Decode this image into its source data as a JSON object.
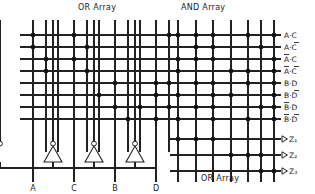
{
  "diagram": {
    "headers": {
      "or_array_top": "OR Array",
      "and_array_top": "AND Array",
      "or_array_bottom": "OR Array"
    },
    "inputs": [
      {
        "id": "A",
        "label": "A",
        "x": 33
      },
      {
        "id": "C",
        "label": "C",
        "x": 74
      },
      {
        "id": "B",
        "label": "B",
        "x": 115
      },
      {
        "id": "D",
        "label": "D",
        "x": 156
      }
    ],
    "product_terms": [
      {
        "label": "A·C",
        "base": "A·C",
        "bar_left": false,
        "bar_right": false,
        "y": 35
      },
      {
        "label": "A·C̅",
        "base": "A·C",
        "bar_left": false,
        "bar_right": true,
        "y": 47
      },
      {
        "label": "A̅·C",
        "base": "A·C",
        "bar_left": true,
        "bar_right": false,
        "y": 59
      },
      {
        "label": "A̅·C̅",
        "base": "A·C",
        "bar_left": true,
        "bar_right": true,
        "y": 71
      },
      {
        "label": "B·D",
        "base": "B·D",
        "bar_left": false,
        "bar_right": false,
        "y": 83
      },
      {
        "label": "B·D̅",
        "base": "B·D",
        "bar_left": false,
        "bar_right": true,
        "y": 95
      },
      {
        "label": "B̅·D",
        "base": "B·D",
        "bar_left": true,
        "bar_right": false,
        "y": 107
      },
      {
        "label": "B̅·D̅",
        "base": "B·D",
        "bar_left": true,
        "bar_right": true,
        "y": 119
      }
    ],
    "outputs": [
      {
        "label": "Z₁",
        "y": 139
      },
      {
        "label": "Z₂",
        "y": 155
      },
      {
        "label": "Z₃",
        "y": 171
      }
    ],
    "colors": {
      "line": "#222222",
      "dot": "#111111",
      "text": "#1a1a1a",
      "background": "#ffffff"
    },
    "geometry": {
      "v_lines_left": [
        33,
        46,
        58,
        74,
        87,
        99,
        115,
        128,
        140,
        156,
        169
      ],
      "v_lines_right": [
        178,
        196,
        213,
        231,
        248,
        261,
        274
      ],
      "row_x_start": 20,
      "row_x_end": 281,
      "out_row_x_start": 170
    },
    "or_dots": [
      {
        "r": 0,
        "x": 33
      },
      {
        "r": 0,
        "x": 74
      },
      {
        "r": 0,
        "x": 169
      },
      {
        "r": 1,
        "x": 33
      },
      {
        "r": 1,
        "x": 87
      },
      {
        "r": 2,
        "x": 46
      },
      {
        "r": 2,
        "x": 74
      },
      {
        "r": 3,
        "x": 46
      },
      {
        "r": 3,
        "x": 87
      },
      {
        "r": 4,
        "x": 115
      },
      {
        "r": 4,
        "x": 156
      },
      {
        "r": 4,
        "x": 169
      },
      {
        "r": 5,
        "x": 99
      },
      {
        "r": 5,
        "x": 156
      },
      {
        "r": 6,
        "x": 115
      },
      {
        "r": 6,
        "x": 140
      },
      {
        "r": 6,
        "x": 169
      },
      {
        "r": 7,
        "x": 128
      },
      {
        "r": 7,
        "x": 156
      }
    ],
    "and_dots": [
      {
        "r": 0,
        "x": 178
      },
      {
        "r": 0,
        "x": 196
      },
      {
        "r": 0,
        "x": 213
      },
      {
        "r": 0,
        "x": 248
      },
      {
        "r": 0,
        "x": 274
      },
      {
        "r": 1,
        "x": 196
      },
      {
        "r": 1,
        "x": 213
      },
      {
        "r": 1,
        "x": 261
      },
      {
        "r": 2,
        "x": 178
      },
      {
        "r": 2,
        "x": 196
      },
      {
        "r": 2,
        "x": 213
      },
      {
        "r": 2,
        "x": 274
      },
      {
        "r": 3,
        "x": 178
      },
      {
        "r": 3,
        "x": 231
      },
      {
        "r": 3,
        "x": 248
      },
      {
        "r": 3,
        "x": 274
      },
      {
        "r": 4,
        "x": 196
      },
      {
        "r": 4,
        "x": 213
      },
      {
        "r": 4,
        "x": 248
      },
      {
        "r": 4,
        "x": 274
      },
      {
        "r": 5,
        "x": 178
      },
      {
        "r": 5,
        "x": 213
      },
      {
        "r": 5,
        "x": 231
      },
      {
        "r": 5,
        "x": 274
      },
      {
        "r": 6,
        "x": 196
      },
      {
        "r": 6,
        "x": 213
      },
      {
        "r": 6,
        "x": 261
      },
      {
        "r": 6,
        "x": 274
      },
      {
        "r": 7,
        "x": 178
      },
      {
        "r": 7,
        "x": 213
      },
      {
        "r": 7,
        "x": 248
      },
      {
        "r": 7,
        "x": 274
      }
    ],
    "out_dots": [
      {
        "r": 0,
        "x": 178
      },
      {
        "r": 0,
        "x": 196
      },
      {
        "r": 0,
        "x": 213
      },
      {
        "r": 1,
        "x": 231
      },
      {
        "r": 1,
        "x": 248
      },
      {
        "r": 1,
        "x": 261
      },
      {
        "r": 2,
        "x": 261
      },
      {
        "r": 2,
        "x": 274
      }
    ]
  }
}
